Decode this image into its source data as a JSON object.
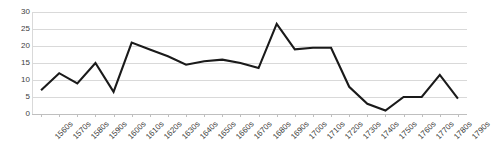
{
  "chart_data": {
    "type": "line",
    "title": "",
    "subtitle": "",
    "xlabel": "",
    "ylabel": "",
    "categories": [
      "1560s",
      "1570s",
      "1580s",
      "1590s",
      "1600s",
      "1610s",
      "1620s",
      "1630s",
      "1640s",
      "1650s",
      "1660s",
      "1670s",
      "1680s",
      "1690s",
      "1700s",
      "1710s",
      "1720s",
      "1730s",
      "1740s",
      "1750s",
      "1760s",
      "1770s",
      "1780s",
      "1790s"
    ],
    "values": [
      7,
      12,
      9,
      15,
      6.5,
      21,
      19,
      17,
      14.5,
      15.5,
      16,
      15,
      13.5,
      26.5,
      19,
      19.5,
      19.5,
      8,
      3,
      1,
      5,
      5,
      11.5,
      4.5
    ],
    "series": [
      {
        "name": "series-1",
        "color": "#1a1a1a",
        "values": [
          7,
          12,
          9,
          15,
          6.5,
          21,
          19,
          17,
          14.5,
          15.5,
          16,
          15,
          13.5,
          26.5,
          19,
          19.5,
          19.5,
          8,
          3,
          1,
          5,
          5,
          11.5,
          4.5
        ]
      }
    ],
    "ylim": [
      0,
      30
    ],
    "yticks": [
      0,
      5,
      10,
      15,
      20,
      25,
      30
    ],
    "ytick_labels": [
      "0",
      "5",
      "10",
      "15",
      "20",
      "25",
      "30"
    ],
    "grid": "horizontal",
    "legend": "none",
    "line_color": "#1a1a1a",
    "grid_color": "#d9d9d9",
    "background": "#ffffff",
    "markers": false
  }
}
